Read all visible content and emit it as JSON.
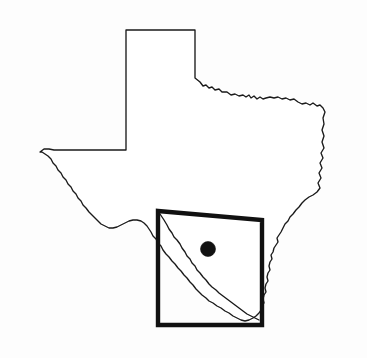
{
  "figure": {
    "kind": "map",
    "width_px": 367,
    "height_px": 358,
    "background_color": "#fdfdfd",
    "outline_color": "#1a1a1a",
    "box_color": "#111111",
    "dot_color": "#121212",
    "has_visible_text": false,
    "title": "",
    "caption": ""
  },
  "layers": {
    "state_boundary": {
      "name": "texas-state-boundary",
      "stroke_width": 1.35,
      "fill": "#ffffff"
    },
    "study_area_box": {
      "name": "study-area-rectangle",
      "stroke_width": 4.4,
      "corners_px": {
        "top_left": [
          158,
          211
        ],
        "top_right": [
          262,
          220
        ],
        "bottom_right": [
          262,
          325
        ],
        "bottom_left": [
          158,
          325
        ]
      },
      "label": ""
    },
    "site_marker": {
      "name": "study-site-point",
      "center_px": [
        208,
        249
      ],
      "radius_px": 7.5,
      "label": ""
    },
    "rio_grande_segment": {
      "name": "rio-grande-inside-box",
      "stroke_width": 1.35
    }
  },
  "chart_data": {
    "type": "map",
    "title": "",
    "xlabel": "",
    "ylabel": "",
    "legend": [],
    "annotations": [],
    "features": [
      {
        "id": "texas-outline",
        "type": "polygon",
        "label": "Texas state boundary",
        "style": "thin-black-line"
      },
      {
        "id": "study-area-box",
        "type": "rectangle",
        "label": "Study area",
        "style": "thick-black-line",
        "bounds_px": [
          158,
          211,
          262,
          325
        ]
      },
      {
        "id": "site-point",
        "type": "point",
        "label": "Site location",
        "style": "filled-black-circle",
        "position_px": [
          208,
          249
        ]
      }
    ]
  }
}
